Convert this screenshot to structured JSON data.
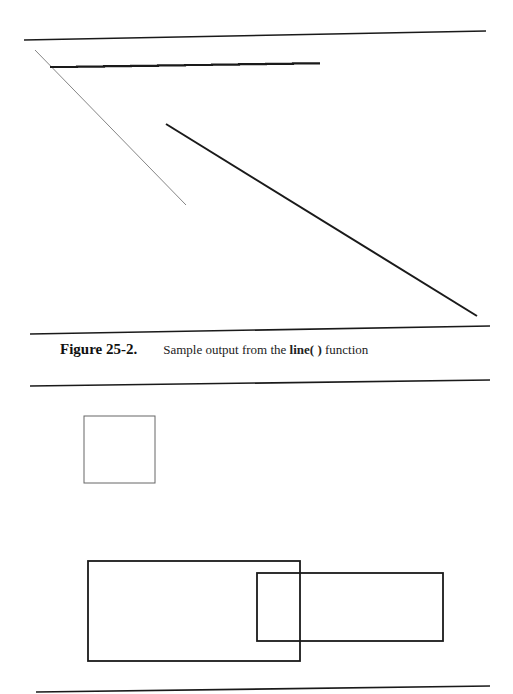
{
  "figure": {
    "label": "Figure 25-2.",
    "caption_prefix": "Sample output from the ",
    "caption_function": "line( )",
    "caption_suffix": " function"
  },
  "colors": {
    "ink": "#1a1a1a",
    "light_ink": "#666666",
    "background": "#ffffff"
  },
  "drawing": {
    "rules": [
      {
        "x1": 24,
        "y1": 40,
        "x2": 486,
        "y2": 31
      },
      {
        "x1": 30,
        "y1": 334,
        "x2": 490,
        "y2": 326
      },
      {
        "x1": 30,
        "y1": 386,
        "x2": 490,
        "y2": 380
      },
      {
        "x1": 36,
        "y1": 692,
        "x2": 490,
        "y2": 686
      }
    ],
    "lines": [
      {
        "name": "thin-diagonal-line",
        "x1": 35,
        "y1": 50,
        "x2": 186,
        "y2": 205,
        "width": 0.8,
        "color": "#666666"
      },
      {
        "name": "thick-diagonal-line",
        "x1": 166,
        "y1": 124,
        "x2": 477,
        "y2": 316,
        "width": 2,
        "color": "#1a1a1a"
      }
    ],
    "stepped_line": {
      "x1": 50,
      "y1": 67,
      "x2": 320,
      "y2": 63,
      "steps": 10,
      "width": 2.2
    },
    "rects": [
      {
        "name": "small-square",
        "x": 84,
        "y": 416,
        "w": 71,
        "h": 67,
        "width": 1,
        "color": "#666666"
      },
      {
        "name": "large-rectangle",
        "x": 88,
        "y": 561,
        "w": 212,
        "h": 100,
        "width": 1.8,
        "color": "#1a1a1a"
      },
      {
        "name": "overlapping-rectangle",
        "x": 257,
        "y": 573,
        "w": 186,
        "h": 68,
        "width": 1.8,
        "color": "#1a1a1a"
      }
    ]
  }
}
